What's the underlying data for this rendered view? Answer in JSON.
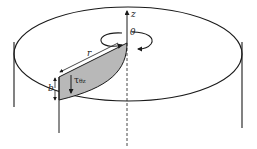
{
  "diagram": {
    "labels": {
      "z_axis": "z",
      "theta": "θ",
      "radius": "r",
      "height": "b",
      "shear_stress": "τ",
      "shear_stress_subscript": "θz"
    },
    "colors": {
      "stroke": "#1a1a1a",
      "wedge_fill": "#b8b8b8",
      "background": "#ffffff"
    }
  }
}
